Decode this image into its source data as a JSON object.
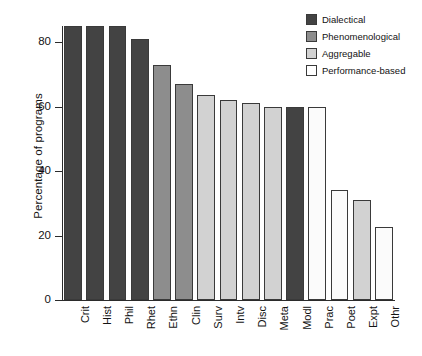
{
  "chart_data": {
    "type": "bar",
    "title": "",
    "xlabel": "",
    "ylabel": "Percentage of programs",
    "ylim": [
      0,
      85
    ],
    "yticks": [
      0,
      20,
      40,
      60,
      80
    ],
    "grid": false,
    "legend_position": "top-right",
    "categories": [
      "Crit",
      "Hist",
      "Phil",
      "Rhet",
      "Ethn",
      "Clin",
      "Surv",
      "Intv",
      "Disc",
      "Meta",
      "Modl",
      "Prac",
      "Poet",
      "Expt",
      "Othr"
    ],
    "values": [
      85,
      85,
      85,
      81,
      73,
      67,
      63.5,
      62,
      61,
      60,
      60,
      60,
      34,
      31,
      22.5
    ],
    "groups": [
      "Dialectical",
      "Dialectical",
      "Dialectical",
      "Dialectical",
      "Phenomenological",
      "Phenomenological",
      "Aggregable",
      "Aggregable",
      "Aggregable",
      "Aggregable",
      "Dialectical",
      "Performance-based",
      "Performance-based",
      "Aggregable",
      "Performance-based"
    ],
    "series": [
      {
        "name": "Dialectical",
        "color": "#434343"
      },
      {
        "name": "Phenomenological",
        "color": "#8d8d8d"
      },
      {
        "name": "Aggregable",
        "color": "#d2d2d2"
      },
      {
        "name": "Performance-based",
        "color": "#fbfbfb"
      }
    ],
    "legend": [
      {
        "label": "Dialectical",
        "color": "#434343"
      },
      {
        "label": "Phenomenological",
        "color": "#8d8d8d"
      },
      {
        "label": "Aggregable",
        "color": "#d2d2d2"
      },
      {
        "label": "Performance-based",
        "color": "#ffffff"
      }
    ]
  }
}
